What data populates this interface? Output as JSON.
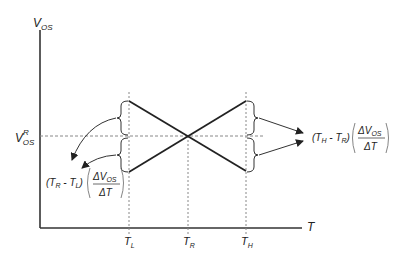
{
  "diagram": {
    "y_axis_label": "V",
    "y_axis_label_sub": "OS",
    "x_axis_label": "T",
    "ref_level_label": "V",
    "ref_level_sup": "R",
    "ref_level_sub": "OS",
    "ticks": [
      {
        "main": "T",
        "sub": "L"
      },
      {
        "main": "T",
        "sub": "R"
      },
      {
        "main": "T",
        "sub": "H"
      }
    ],
    "left_expression": {
      "prefix": "(T",
      "sub1": "R",
      "mid": " - T",
      "sub2": "L",
      "close": ")",
      "numerator": "ΔV",
      "numerator_sub": "OS",
      "denominator": "ΔT"
    },
    "right_expression": {
      "prefix": "(T",
      "sub1": "H",
      "mid": " - T",
      "sub2": "R",
      "close": ")",
      "numerator": "ΔV",
      "numerator_sub": "OS",
      "denominator": "ΔT"
    },
    "colors": {
      "line": "#222222",
      "dashed": "#777777"
    }
  }
}
